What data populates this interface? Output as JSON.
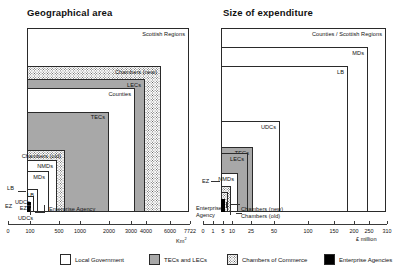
{
  "chart_data": [
    {
      "type": "bar",
      "title": "Geographical area",
      "xlabel": "Km²",
      "ylabel": "",
      "grid": false,
      "legend_position": "bottom",
      "axis_ticks": [
        "0",
        "100",
        "500",
        "1000",
        "2000",
        "3000",
        "4000",
        "6000",
        "7722"
      ],
      "categories": [
        "EZ",
        "UDCs",
        "LB",
        "MDs",
        "NMDs",
        "Chambers (old)",
        "TECs",
        "Counties",
        "LECs",
        "Chambers (new)",
        "Scottish Regions"
      ],
      "values": [
        2,
        5,
        30,
        220,
        480,
        700,
        2700,
        2950,
        6000,
        6600,
        7722
      ],
      "note": "Nested concentric boxes; each box extent corresponds to the value on the Km² axis."
    },
    {
      "type": "bar",
      "title": "Size of expenditure",
      "xlabel": "£ million",
      "ylabel": "",
      "grid": false,
      "legend_position": "bottom",
      "axis_ticks": [
        "0",
        "1",
        "5",
        "10",
        "25",
        "50",
        "100",
        "150",
        "200",
        "250",
        "310"
      ],
      "categories": [
        "Enterprise Agency",
        "Chambers (old)",
        "Chambers (new)",
        "EZ",
        "NMDs",
        "LECs",
        "TECs",
        "UDCs",
        "LB",
        "MDs",
        "Counties / Scottish Regions"
      ],
      "values": [
        0.5,
        1,
        2,
        3,
        9,
        21,
        25,
        100,
        200,
        250,
        310
      ],
      "note": "Nested concentric boxes; each box extent corresponds to the value on the £ million axis."
    }
  ],
  "panels": {
    "left": {
      "title": "Geographical area",
      "axis_unit_prefix": "Km",
      "axis_unit_sup": "2",
      "ticks": [
        {
          "label": "0",
          "x": 8
        },
        {
          "label": "100",
          "x": 30
        },
        {
          "label": "500",
          "x": 59
        },
        {
          "label": "1000",
          "x": 80
        },
        {
          "label": "2000",
          "x": 109
        },
        {
          "label": "3000",
          "x": 131
        },
        {
          "label": "4000",
          "x": 146
        },
        {
          "label": "6000",
          "x": 170
        },
        {
          "label": "7722",
          "x": 190
        }
      ],
      "boxes": [
        {
          "name": "scottish-regions",
          "label": "Scottish Regions",
          "fill": "white",
          "left": 27,
          "top": 28,
          "width": 162,
          "height": 184
        },
        {
          "name": "chambers-new",
          "label": "Chambers (new)",
          "fill": "dots",
          "left": 27,
          "top": 66,
          "width": 134,
          "height": 146
        },
        {
          "name": "lecs",
          "label": "LECs",
          "fill": "gray",
          "left": 27,
          "top": 79,
          "width": 118,
          "height": 133
        },
        {
          "name": "counties",
          "label": "Counties",
          "fill": "white",
          "left": 27,
          "top": 88,
          "width": 108,
          "height": 124
        },
        {
          "name": "tecs",
          "label": "TECs",
          "fill": "gray",
          "left": 27,
          "top": 111.5,
          "width": 82,
          "height": 100.5
        },
        {
          "name": "chambers-old",
          "label": "Chambers (old)",
          "fill": "dots",
          "left": 27,
          "top": 150,
          "width": 38,
          "height": 62
        },
        {
          "name": "nmds",
          "label": "NMDs",
          "fill": "white",
          "left": 27,
          "top": 160,
          "width": 30,
          "height": 52
        },
        {
          "name": "mds",
          "label": "MDs",
          "fill": "white",
          "left": 27,
          "top": 171,
          "width": 22,
          "height": 41
        },
        {
          "name": "lb",
          "label": "LB",
          "fill": "white",
          "left": 27,
          "top": 189,
          "width": 11,
          "height": 23
        },
        {
          "name": "udcs",
          "label": "UDCs",
          "fill": "white",
          "left": 27,
          "top": 196,
          "width": 7,
          "height": 16
        },
        {
          "name": "ez",
          "label": "EZ",
          "fill": "black",
          "left": 27,
          "top": 202,
          "width": 4,
          "height": 10
        }
      ],
      "callouts": [
        {
          "name": "lb",
          "label": "LB",
          "x": 7,
          "y": 185
        },
        {
          "name": "ez",
          "label": "EZ",
          "x": 5,
          "y": 203
        },
        {
          "name": "udcs",
          "label": "UDCs",
          "x": 18,
          "y": 215
        },
        {
          "name": "enterprise-agency",
          "label": "Enterprise Agency",
          "x": 49,
          "y": 206
        }
      ]
    },
    "right": {
      "title": "Size of expenditure",
      "axis_unit_prefix": "£ million",
      "axis_unit_sup": "",
      "ticks": [
        {
          "label": "0",
          "x": 7
        },
        {
          "label": "1",
          "x": 17
        },
        {
          "label": "5",
          "x": 27
        },
        {
          "label": "10",
          "x": 36
        },
        {
          "label": "25",
          "x": 55
        },
        {
          "label": "50",
          "x": 78
        },
        {
          "label": "100",
          "x": 112
        },
        {
          "label": "150",
          "x": 138
        },
        {
          "label": "200",
          "x": 158
        },
        {
          "label": "250",
          "x": 173
        },
        {
          "label": "310",
          "x": 191
        }
      ],
      "boxes": [
        {
          "name": "counties-scottish-regions",
          "label": "Counties / Scottish Regions",
          "fill": "white",
          "left": 25,
          "top": 28,
          "width": 165,
          "height": 184
        },
        {
          "name": "mds",
          "label": "MDs",
          "fill": "white",
          "left": 25,
          "top": 47,
          "width": 147,
          "height": 165
        },
        {
          "name": "lb",
          "label": "LB",
          "fill": "white",
          "left": 25,
          "top": 66,
          "width": 127,
          "height": 146
        },
        {
          "name": "udcs",
          "label": "UDCs",
          "fill": "white",
          "left": 25,
          "top": 121,
          "width": 59,
          "height": 91
        },
        {
          "name": "tecs",
          "label": "TECs",
          "fill": "gray",
          "left": 25,
          "top": 147,
          "width": 32,
          "height": 65
        },
        {
          "name": "lecs",
          "label": "LECs",
          "fill": "gray",
          "left": 25,
          "top": 153,
          "width": 27,
          "height": 59
        },
        {
          "name": "nmds",
          "label": "NMDs",
          "fill": "white",
          "left": 25,
          "top": 173,
          "width": 17,
          "height": 39
        },
        {
          "name": "chambers-new",
          "label": "",
          "fill": "dots",
          "left": 25,
          "top": 186,
          "width": 10,
          "height": 26
        },
        {
          "name": "chambers-old",
          "label": "",
          "fill": "dots",
          "left": 25,
          "top": 192,
          "width": 7,
          "height": 20
        },
        {
          "name": "enterprise-agency-box",
          "label": "",
          "fill": "black",
          "left": 25,
          "top": 199,
          "width": 4,
          "height": 13
        }
      ],
      "callouts": [
        {
          "name": "ez",
          "label": "EZ",
          "x": 6,
          "y": 178
        },
        {
          "name": "enterprise-agency",
          "label": "Enterprise\nAgency",
          "x": 0,
          "y": 205
        },
        {
          "name": "chambers-new",
          "label": "Chambers (new)",
          "x": 45,
          "y": 206
        },
        {
          "name": "chambers-old",
          "label": "Chambers (old)",
          "x": 45,
          "y": 213
        }
      ]
    }
  },
  "legend": {
    "items": [
      {
        "name": "local-government",
        "label": "Local Government",
        "fill": "white",
        "color": "#ffffff",
        "x": 60
      },
      {
        "name": "tecs-and-lecs",
        "label": "TECs and LECs",
        "fill": "gray",
        "color": "#a8a8a8",
        "x": 149
      },
      {
        "name": "chambers-of-commerce",
        "label": "Chambers of Commerce",
        "fill": "dots",
        "color": "#ffffff",
        "x": 227
      },
      {
        "name": "enterprise-agencies",
        "label": "Enterprise Agencies",
        "fill": "black",
        "color": "#000000",
        "x": 324
      }
    ]
  }
}
